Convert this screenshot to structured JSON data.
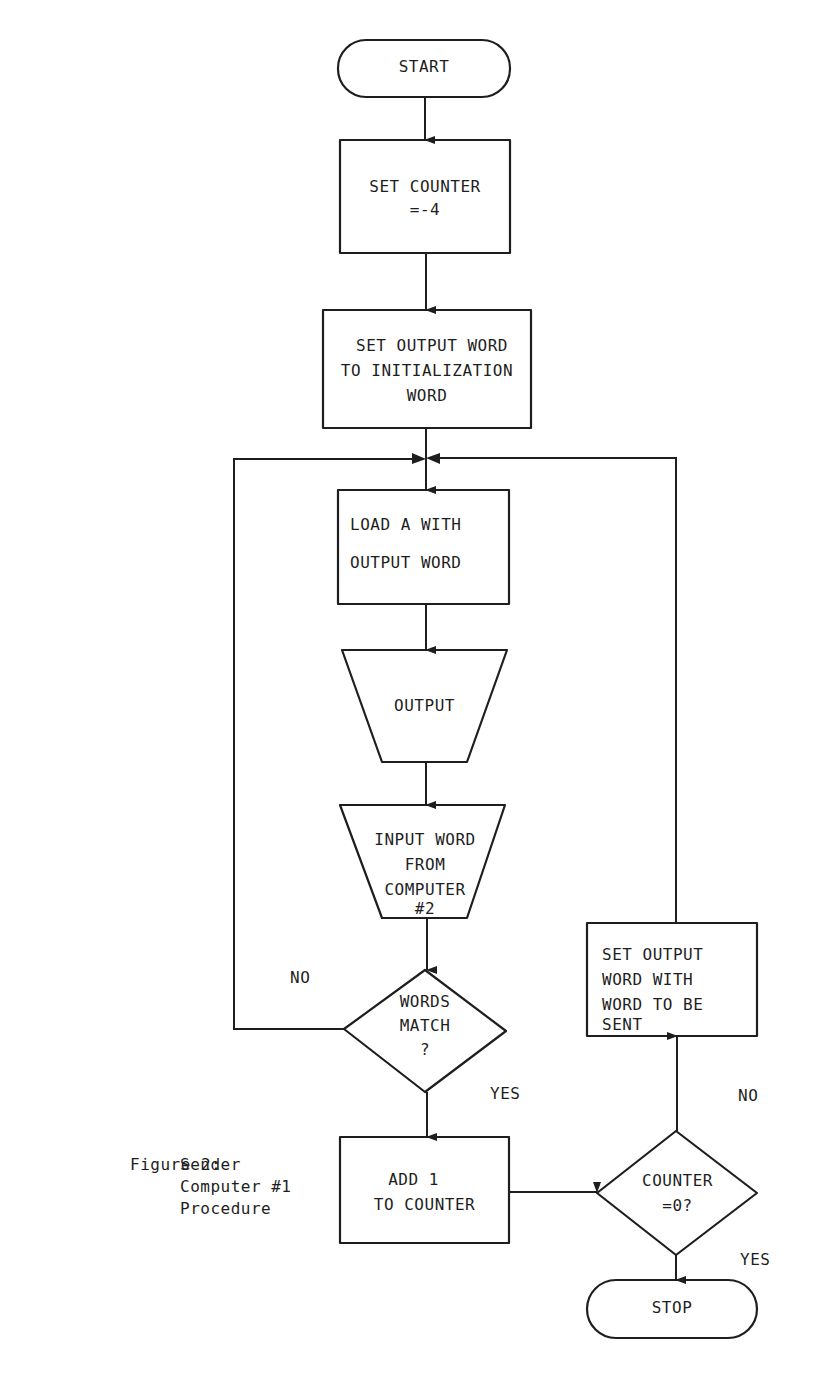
{
  "figure": {
    "caption_label": "Figure 2:",
    "caption_lines": [
      "Sender",
      "Computer #1",
      "Procedure"
    ],
    "page_number": ""
  },
  "colors": {
    "ink": "#1e1e1e",
    "background": "#ffffff"
  },
  "nodes": {
    "start": {
      "type": "terminal",
      "lines": [
        "START"
      ]
    },
    "set_counter": {
      "type": "process",
      "lines": [
        "SET COUNTER",
        "=-4"
      ]
    },
    "set_output_init": {
      "type": "process",
      "lines": [
        "SET OUTPUT WORD",
        "TO INITIALIZATION",
        "WORD"
      ]
    },
    "load_a": {
      "type": "process",
      "lines": [
        "LOAD A WITH",
        "OUTPUT WORD"
      ]
    },
    "output": {
      "type": "manual-operation",
      "lines": [
        "OUTPUT"
      ]
    },
    "input_word": {
      "type": "manual-operation",
      "lines": [
        "INPUT WORD",
        "FROM",
        "COMPUTER",
        "#2"
      ]
    },
    "words_match": {
      "type": "decision",
      "lines": [
        "WORDS",
        "MATCH",
        "?"
      ]
    },
    "add_one": {
      "type": "process",
      "lines": [
        "ADD 1",
        "TO COUNTER"
      ]
    },
    "counter_zero": {
      "type": "decision",
      "lines": [
        "COUNTER",
        "=0?"
      ]
    },
    "set_output_send": {
      "type": "process",
      "lines": [
        "SET OUTPUT",
        "WORD WITH",
        "WORD TO BE",
        "SENT"
      ]
    },
    "stop": {
      "type": "terminal",
      "lines": [
        "STOP"
      ]
    }
  },
  "edge_labels": {
    "words_match_no": "NO",
    "words_match_yes": "YES",
    "counter_zero_no": "NO",
    "counter_zero_yes": "YES"
  },
  "edges": [
    [
      "start",
      "set_counter"
    ],
    [
      "set_counter",
      "set_output_init"
    ],
    [
      "set_output_init",
      "load_a"
    ],
    [
      "load_a",
      "output"
    ],
    [
      "output",
      "input_word"
    ],
    [
      "input_word",
      "words_match"
    ],
    [
      "words_match",
      "load_a",
      "NO"
    ],
    [
      "words_match",
      "add_one",
      "YES"
    ],
    [
      "add_one",
      "counter_zero"
    ],
    [
      "counter_zero",
      "set_output_send",
      "NO"
    ],
    [
      "counter_zero",
      "stop",
      "YES"
    ],
    [
      "set_output_send",
      "load_a"
    ]
  ]
}
